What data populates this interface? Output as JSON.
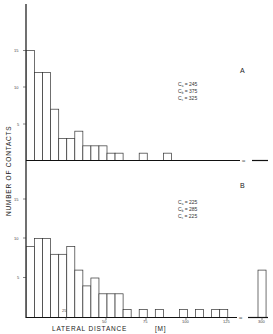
{
  "chart_data": [
    {
      "type": "bar",
      "panel": "A",
      "xlabel": "LATERAL DISTANCE [M]",
      "ylabel": "NUMBER OF CONTACTS",
      "bin_width_m": 5,
      "categories": [
        "0-5",
        "5-10",
        "10-15",
        "15-20",
        "20-25",
        "25-30",
        "30-35",
        "35-40",
        "40-45",
        "45-50",
        "50-55",
        "55-60",
        "60-65",
        "65-70",
        "70-75",
        "75-80",
        "80-85",
        "85-90"
      ],
      "values": [
        15,
        12,
        12,
        7,
        3,
        3,
        4,
        2,
        2,
        2,
        1,
        1,
        0,
        0,
        1,
        0,
        0,
        1
      ],
      "yticks": [
        5,
        10,
        15
      ],
      "ylim": [
        0,
        20
      ],
      "annotations": [
        {
          "label": "C",
          "sub": "a",
          "value": "245"
        },
        {
          "label": "C",
          "sub": "b",
          "value": "375"
        },
        {
          "label": "C",
          "sub": "c",
          "value": "325"
        }
      ],
      "axis_break": true
    },
    {
      "type": "bar",
      "panel": "B",
      "xlabel": "LATERAL DISTANCE [M]",
      "ylabel": "NUMBER OF CONTACTS",
      "bin_width_m": 5,
      "categories": [
        "0-5",
        "5-10",
        "10-15",
        "15-20",
        "20-25",
        "25-30",
        "30-35",
        "35-40",
        "40-45",
        "45-50",
        "50-55",
        "55-60",
        "60-65",
        "65-70",
        "70-75",
        "75-80",
        "80-85",
        "85-90",
        "90-95",
        "95-100",
        "100-105",
        "105-110",
        "110-115",
        "115-120",
        "120-125",
        ">300"
      ],
      "values": [
        9,
        10,
        10,
        8,
        8,
        9,
        6,
        4,
        5,
        3,
        3,
        3,
        1,
        0,
        1,
        0,
        1,
        0,
        0,
        1,
        0,
        1,
        0,
        1,
        1,
        6
      ],
      "xticks": [
        "25",
        "50",
        "75",
        "100",
        "125",
        "300"
      ],
      "yticks": [
        5,
        10,
        15
      ],
      "ylim": [
        0,
        20
      ],
      "annotations": [
        {
          "label": "C",
          "sub": "a",
          "value": "225"
        },
        {
          "label": "C",
          "sub": "b",
          "value": "285"
        },
        {
          "label": "C",
          "sub": "c",
          "value": "225"
        }
      ],
      "axis_break": true
    }
  ],
  "labels": {
    "ylabel": "NUMBER  OF  CONTACTS",
    "xlabel_main": "LATERAL   DISTANCE",
    "xlabel_unit": "[M]",
    "panel_a": "A",
    "panel_b": "B",
    "break_mark": "≈"
  },
  "ticks": {
    "y": [
      "5",
      "10",
      "15"
    ],
    "x": [
      "25",
      "50",
      "75",
      "100",
      "125",
      "300"
    ]
  }
}
